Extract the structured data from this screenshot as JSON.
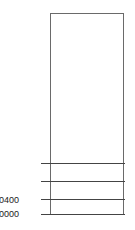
{
  "diagram": {
    "type": "memory-map",
    "box": {
      "border_color": "#6a6a6a"
    },
    "divider_color": "#444444",
    "dividers": [
      {
        "y": 163,
        "label": ""
      },
      {
        "y": 181,
        "label": ""
      },
      {
        "y": 199,
        "label": "0400"
      },
      {
        "y": 214,
        "label": "0000"
      }
    ],
    "labels": {
      "addr_0400": "0400",
      "addr_0000": "0000"
    }
  }
}
